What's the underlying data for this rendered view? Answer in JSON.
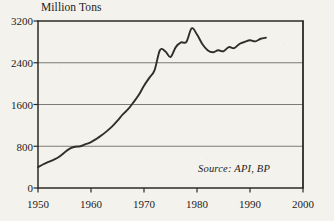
{
  "chart_data": {
    "type": "line",
    "title": "Million Tons",
    "subtitle": "",
    "xlabel": "",
    "ylabel": "Million Tons",
    "xlim": [
      1950,
      2000
    ],
    "ylim": [
      0,
      3200
    ],
    "grid": "horizontal",
    "legend": "none",
    "annotations": [
      {
        "name": "source",
        "text": "Source: API, BP",
        "position": "bottom-right-inside-plot"
      }
    ],
    "yticks": [
      0,
      800,
      1600,
      2400,
      3200
    ],
    "ytick_labels": [
      "0",
      "800",
      "1600",
      "2400",
      "3200"
    ],
    "xticks": [
      1950,
      1960,
      1970,
      1980,
      1990,
      2000
    ],
    "xtick_labels": [
      "1950",
      "1960",
      "1970",
      "1980",
      "1990",
      "2000"
    ],
    "series": [
      {
        "name": "World Oil Production",
        "color": "#302e2b",
        "x": [
          1950,
          1951,
          1952,
          1953,
          1954,
          1955,
          1956,
          1957,
          1958,
          1959,
          1960,
          1961,
          1962,
          1963,
          1964,
          1965,
          1966,
          1967,
          1968,
          1969,
          1970,
          1971,
          1972,
          1973,
          1974,
          1975,
          1976,
          1977,
          1978,
          1979,
          1980,
          1981,
          1982,
          1983,
          1984,
          1985,
          1986,
          1987,
          1988,
          1989,
          1990,
          1991,
          1992,
          1993
        ],
        "values": [
          400,
          455,
          500,
          545,
          600,
          680,
          755,
          790,
          800,
          840,
          880,
          940,
          1010,
          1090,
          1180,
          1290,
          1410,
          1510,
          1640,
          1780,
          1960,
          2110,
          2260,
          2640,
          2620,
          2510,
          2700,
          2790,
          2800,
          3060,
          2940,
          2760,
          2640,
          2600,
          2640,
          2620,
          2700,
          2680,
          2760,
          2800,
          2830,
          2810,
          2860,
          2880
        ],
        "x_start": 1950,
        "x_end": 1993
      }
    ]
  },
  "figure": {
    "background_color": "#f4f2ed",
    "ink_color": "#1d1c1a",
    "grid_color": "#6e6c68",
    "line_color": "#302e2b",
    "plot_left_px": 38,
    "plot_right_px": 303,
    "plot_top_px": 21,
    "plot_bottom_px": 188
  }
}
